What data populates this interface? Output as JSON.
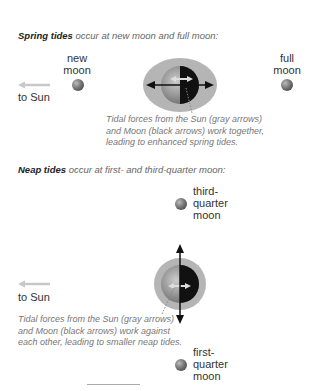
{
  "spring": {
    "heading_bold": "Spring tides",
    "heading_rest": " occur at new moon and full moon:",
    "new_moon_label": [
      "new",
      "moon"
    ],
    "full_moon_label": [
      "full",
      "moon"
    ],
    "sun_label": "to Sun",
    "caption": [
      "Tidal forces from the Sun (gray arrows)",
      "and Moon (black arrows) work together,",
      "leading to enhanced spring tides."
    ]
  },
  "neap": {
    "heading_bold": "Neap tides",
    "heading_rest": " occur at first- and third-quarter moon:",
    "third_quarter_label": [
      "third-",
      "quarter",
      "moon"
    ],
    "first_quarter_label": [
      "first-",
      "quarter",
      "moon"
    ],
    "sun_label": "to Sun",
    "caption": [
      "Tidal forces from the Sun (gray arrows)",
      "and Moon (black arrows) work against",
      "each other, leading to smaller neap tides."
    ]
  },
  "colors": {
    "tidal_bulge": "#b5b5b5",
    "earth_day": "#999999",
    "earth_night": "#111111",
    "sun_arrow": "#c0c0c0",
    "moon_arrow": "#111111"
  }
}
